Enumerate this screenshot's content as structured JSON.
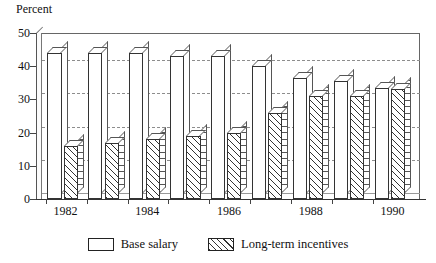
{
  "chart_data": {
    "type": "bar",
    "title": "",
    "xlabel": "",
    "ylabel": "Percent",
    "ylim": [
      0,
      50
    ],
    "yticks": [
      0,
      10,
      20,
      30,
      40,
      50
    ],
    "ytick_labels": [
      "0",
      "10",
      "20",
      "30",
      "40",
      "50"
    ],
    "grid": true,
    "gridlines_at": [
      10,
      20,
      30,
      40
    ],
    "legend_position": "bottom-center",
    "categories": [
      "1982",
      "1983",
      "1984",
      "1985",
      "1986",
      "1987",
      "1988",
      "1989",
      "1990"
    ],
    "visible_tick_labels": [
      "1982",
      "1984",
      "1986",
      "1988",
      "1990"
    ],
    "series": [
      {
        "name": "Base salary",
        "fill": "white",
        "values": [
          44,
          44,
          44,
          43,
          43,
          40,
          36.5,
          35.5,
          33.5
        ]
      },
      {
        "name": "Long-term incentives",
        "fill": "diagonal-hatch",
        "values": [
          16,
          17,
          18,
          19,
          20,
          26,
          31,
          31,
          33
        ]
      }
    ]
  },
  "axis": {
    "y_title": "Percent"
  },
  "legend": {
    "items": [
      {
        "label": "Base salary",
        "swatch": "white-box-icon"
      },
      {
        "label": "Long-term incentives",
        "swatch": "hatched-box-icon"
      }
    ]
  },
  "colors": {
    "background": "#ffffff",
    "ink": "#111111",
    "gridline": "#8d8d8d",
    "bar_outline": "#333333"
  }
}
